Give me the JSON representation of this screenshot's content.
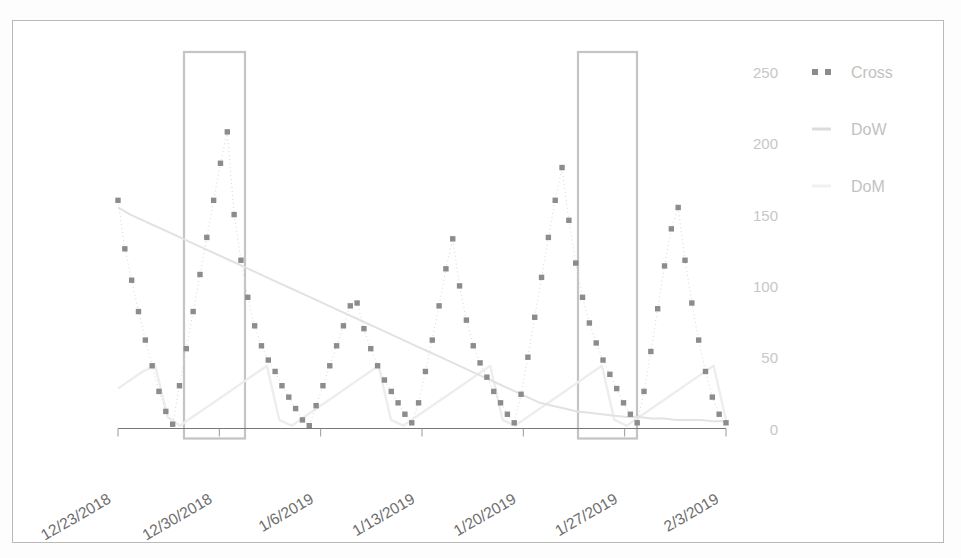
{
  "figure": {
    "background_color": "#ffffff",
    "border_color": "#b9b9b9"
  },
  "chart_data": {
    "type": "line",
    "title": "",
    "xlabel": "",
    "ylabel": "",
    "ylim": [
      0,
      265
    ],
    "yticks": [
      0,
      50,
      100,
      150,
      200,
      250
    ],
    "ytick_labels": [
      "0",
      "50",
      "100",
      "150",
      "200",
      "250"
    ],
    "grid": false,
    "legend_position": "upper-right",
    "x_tick_labels": [
      "12/23/2018",
      "12/30/2018",
      "1/6/2019",
      "1/13/2019",
      "1/20/2019",
      "1/27/2019",
      "2/3/2019"
    ],
    "x_tick_rotation_degrees": -30,
    "x_range_days": [
      0,
      49
    ],
    "series": [
      {
        "name": "Cross",
        "style": "dotted-markers",
        "color": "#8c8c8c",
        "marker": "square",
        "values": [
          160,
          126,
          104,
          82,
          62,
          44,
          26,
          12,
          3,
          30,
          56,
          82,
          108,
          134,
          160,
          186,
          208,
          150,
          118,
          92,
          72,
          58,
          48,
          40,
          30,
          22,
          14,
          6,
          2,
          16,
          30,
          44,
          58,
          72,
          86,
          88,
          70,
          56,
          44,
          34,
          26,
          18,
          10,
          4,
          18,
          40,
          62,
          86,
          112,
          133,
          100,
          76,
          58,
          46,
          36,
          26,
          18,
          10,
          4,
          24,
          50,
          78,
          106,
          134,
          160,
          183,
          146,
          116,
          92,
          74,
          60,
          48,
          38,
          28,
          18,
          10,
          4,
          26,
          54,
          84,
          114,
          140,
          155,
          118,
          88,
          62,
          40,
          22,
          10,
          4
        ]
      },
      {
        "name": "DoW",
        "style": "line",
        "color": "#e2e2e2",
        "values": [
          155,
          150,
          146,
          142,
          138,
          134,
          130,
          126,
          122,
          118,
          114,
          110,
          106,
          102,
          98,
          94,
          90,
          86,
          82,
          78,
          74,
          70,
          66,
          62,
          58,
          54,
          50,
          46,
          42,
          38,
          34,
          30,
          26,
          22,
          18,
          16,
          14,
          12,
          11,
          10,
          9,
          8,
          8,
          7,
          7,
          6,
          6,
          6,
          5,
          5
        ]
      },
      {
        "name": "DoM",
        "style": "line",
        "color": "#ededed",
        "sawtooth_peak": 45,
        "values": [
          28,
          34,
          40,
          44,
          8,
          2,
          8,
          14,
          20,
          26,
          32,
          38,
          44,
          6,
          2,
          8,
          14,
          20,
          26,
          32,
          38,
          44,
          6,
          2,
          8,
          14,
          20,
          26,
          32,
          38,
          44,
          6,
          2,
          8,
          14,
          20,
          26,
          32,
          38,
          44,
          6,
          2,
          8,
          14,
          20,
          26,
          32,
          38,
          44,
          6
        ]
      }
    ],
    "annotations": [
      {
        "type": "highlight-rectangle",
        "name": "highlight-box-1",
        "x_start_label": "12/29/2018",
        "x_end_label": "1/3/2019",
        "color": "#c4c4c4"
      },
      {
        "type": "highlight-rectangle",
        "name": "highlight-box-2",
        "x_start_label": "1/26/2019",
        "x_end_label": "1/31/2019",
        "color": "#c4c4c4"
      }
    ]
  },
  "legend": {
    "items": [
      {
        "label": "Cross",
        "color": "#8c8c8c",
        "marker": "dotted-squares"
      },
      {
        "label": "DoW",
        "color": "#dcdcdc",
        "marker": "short-line"
      },
      {
        "label": "DoM",
        "color": "#f0f0f0",
        "marker": "short-line"
      }
    ]
  }
}
